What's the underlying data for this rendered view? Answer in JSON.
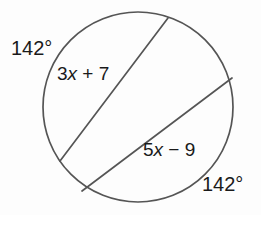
{
  "figure": {
    "background_color": "#fdfdfd",
    "stroke_color": "#555555",
    "text_color": "#1a1a1a",
    "circle": {
      "cx": 138,
      "cy": 107,
      "r": 95
    },
    "chords": [
      {
        "name": "upper-chord",
        "x1": 168,
        "y1": 18,
        "x2": 60,
        "y2": 161
      },
      {
        "name": "lower-chord",
        "x1": 232,
        "y1": 78,
        "x2": 82,
        "y2": 191
      }
    ]
  },
  "labels": {
    "arc_top_left": "142°",
    "arc_bottom_right": "142°",
    "chord_upper": {
      "full": "3x + 7",
      "coefficient": "3",
      "variable": "x",
      "operator": " + ",
      "constant": "7"
    },
    "chord_lower": {
      "full": "5x − 9",
      "coefficient": "5",
      "variable": "x",
      "operator": " − ",
      "constant": "9"
    }
  },
  "chart_data": {
    "type": "diagram",
    "shapes": [
      {
        "kind": "circle",
        "center": [
          138,
          107
        ],
        "radius": 95
      },
      {
        "kind": "chord",
        "label": "3x + 7",
        "endpoints": [
          [
            168,
            18
          ],
          [
            60,
            161
          ]
        ]
      },
      {
        "kind": "chord",
        "label": "5x − 9",
        "endpoints": [
          [
            232,
            78
          ],
          [
            82,
            191
          ]
        ]
      }
    ],
    "annotations": [
      {
        "text": "142°",
        "position": "outside-upper-left",
        "refers_to": "arc cut by upper chord"
      },
      {
        "text": "3x + 7",
        "position": "inside-upper-left",
        "refers_to": "upper chord length"
      },
      {
        "text": "5x − 9",
        "position": "inside-lower-right",
        "refers_to": "lower chord length"
      },
      {
        "text": "142°",
        "position": "outside-lower-right",
        "refers_to": "arc cut by lower chord"
      }
    ]
  }
}
